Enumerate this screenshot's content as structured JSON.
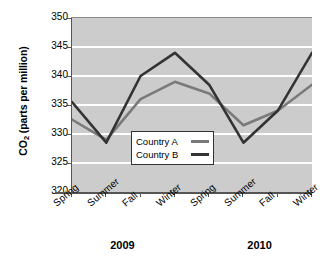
{
  "chart_data": {
    "type": "line",
    "title": "",
    "xlabel": "",
    "ylabel": "CO2 (parts per million)",
    "ylabel_prefix": "CO",
    "ylabel_sub": "2",
    "ylabel_suffix": " (parts per million)",
    "categories": [
      "Spring",
      "Summer",
      "Fall",
      "Winter",
      "Spring",
      "Summer",
      "Fall",
      "Winter"
    ],
    "group_labels": [
      "2009",
      "2010"
    ],
    "ylim": [
      320,
      350
    ],
    "ytick_labels": [
      "350",
      "345",
      "340",
      "335",
      "330",
      "325",
      "320"
    ],
    "ytick_values": [
      350,
      345,
      340,
      335,
      330,
      325,
      320
    ],
    "grid": true,
    "grid_axis": "y",
    "legend_position": "inside-center",
    "series": [
      {
        "name": "Country A",
        "color": "#7a7a7a",
        "values": [
          332.5,
          329,
          336,
          339,
          337,
          331.5,
          334,
          338.5
        ]
      },
      {
        "name": "Country B",
        "color": "#333333",
        "values": [
          335.5,
          328.5,
          340,
          344,
          338.5,
          328.5,
          334,
          344
        ]
      }
    ]
  },
  "colors": {
    "plot_background": "#cccccc",
    "gridline": "#ffffff",
    "axis": "#555555",
    "legend_background": "#ffffff",
    "legend_border": "#333333",
    "page_background": "#ffffff"
  }
}
